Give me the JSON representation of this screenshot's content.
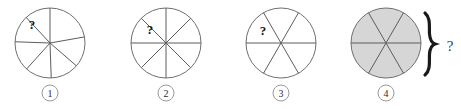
{
  "figure": {
    "background_color": "#ffffff",
    "shade_color": "#d6d6d6",
    "outline_color": "#6f6f6f",
    "line_color": "#5d5d5d",
    "question_symbol": "?",
    "brace_symbol": "}",
    "brace_question": "?"
  },
  "circles": [
    {
      "label": "1",
      "center_x": 50,
      "center_y": 43,
      "radius": 35,
      "sector_count": 6,
      "equal_sectors": false,
      "shaded_sector_count": 1,
      "all_shaded": false,
      "marked_text": "?",
      "marked_x": 32,
      "marked_y": 24,
      "boundary_angles": [
        90,
        133,
        182,
        228,
        272,
        318,
        10
      ],
      "shaded_ranges": [
        [
          90,
          133
        ]
      ]
    },
    {
      "label": "2",
      "center_x": 166,
      "center_y": 43,
      "radius": 35,
      "sector_count": 8,
      "equal_sectors": true,
      "shaded_sector_count": 1,
      "all_shaded": false,
      "marked_text": "?",
      "marked_x": 150,
      "marked_y": 29,
      "boundary_angles": [
        0,
        45,
        90,
        135,
        180,
        225,
        270,
        315
      ],
      "shaded_ranges": [
        [
          135,
          180
        ]
      ]
    },
    {
      "label": "3",
      "center_x": 281,
      "center_y": 43,
      "radius": 35,
      "sector_count": 6,
      "equal_sectors": true,
      "shaded_sector_count": 1,
      "all_shaded": false,
      "marked_text": "?",
      "marked_x": 263,
      "marked_y": 30,
      "boundary_angles": [
        0,
        60,
        120,
        180,
        240,
        300
      ],
      "shaded_ranges": [
        [
          120,
          180
        ]
      ]
    },
    {
      "label": "4",
      "center_x": 386,
      "center_y": 43,
      "radius": 35,
      "sector_count": 6,
      "equal_sectors": true,
      "shaded_sector_count": 6,
      "all_shaded": true,
      "marked_text": "",
      "marked_x": 0,
      "marked_y": 0,
      "boundary_angles": [
        0,
        60,
        120,
        180,
        240,
        300
      ],
      "shaded_ranges": [
        [
          0,
          360
        ]
      ]
    }
  ],
  "labels": [
    {
      "text": "1",
      "x": 50,
      "y": 93
    },
    {
      "text": "2",
      "x": 166,
      "y": 93
    },
    {
      "text": "3",
      "x": 281,
      "y": 93
    },
    {
      "text": "4",
      "x": 386,
      "y": 93
    }
  ],
  "brace": {
    "x": 429,
    "y_top": 12,
    "y_bottom": 76,
    "question_x": 450,
    "question_y": 46
  }
}
